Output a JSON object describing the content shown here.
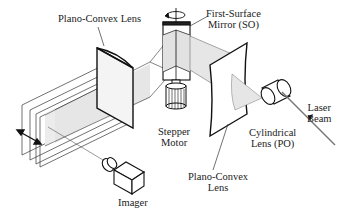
{
  "diagram": {
    "type": "optical-schematic",
    "labels": {
      "plano_convex_lens_top": "Plano-Convex Lens",
      "first_surface_mirror_line1": "First-Surface",
      "first_surface_mirror_line2": "Mirror (SO)",
      "stepper_motor_line1": "Stepper",
      "stepper_motor_line2": "Motor",
      "plano_convex_lens_bottom_line1": "Plano-Convex",
      "plano_convex_lens_bottom_line2": "Lens",
      "cylindrical_lens_line1": "Cylindrical",
      "cylindrical_lens_line2": "Lens (PO)",
      "laser_beam_line1": "Laser",
      "laser_beam_line2": "Beam",
      "imager": "Imager"
    },
    "components": [
      "Plano-Convex Lens (imaging side)",
      "First-Surface Mirror (SO)",
      "Stepper Motor",
      "Plano-Convex Lens (laser side)",
      "Cylindrical Lens (PO)",
      "Laser Beam",
      "Imager",
      "Light sheet planes"
    ],
    "colors": {
      "line": "#111111",
      "beam_fill": "#e6e6e6",
      "laser_line": "#777777",
      "background": "#ffffff"
    }
  }
}
